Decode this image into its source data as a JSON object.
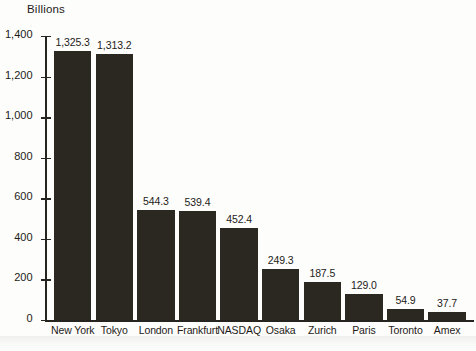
{
  "chart_data": {
    "type": "bar",
    "title": "Billions",
    "xlabel": "",
    "ylabel": "",
    "ylim": [
      0,
      1400
    ],
    "yticks": [
      0,
      200,
      400,
      600,
      800,
      1000,
      1200,
      1400
    ],
    "ytick_labels": [
      "0",
      "200",
      "400",
      "600",
      "800",
      "1,000",
      "1,200",
      "1,400"
    ],
    "grid": false,
    "legend": "none",
    "bar_color": "#2b2721",
    "axis_color": "#26241f",
    "categories": [
      "New York",
      "Tokyo",
      "London",
      "Frankfurt",
      "NASDAQ",
      "Osaka",
      "Zurich",
      "Paris",
      "Toronto",
      "Amex"
    ],
    "values": [
      1325.3,
      1313.2,
      544.3,
      539.4,
      452.4,
      249.3,
      187.5,
      129.0,
      54.9,
      37.7
    ],
    "value_labels": [
      "1,325.3",
      "1,313.2",
      "544.3",
      "539.4",
      "452.4",
      "249.3",
      "187.5",
      "129.0",
      "54.9",
      "37.7"
    ]
  }
}
